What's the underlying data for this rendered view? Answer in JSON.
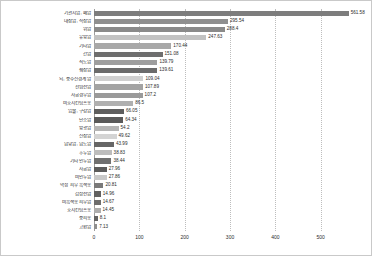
{
  "chart_data": {
    "type": "bar",
    "orientation": "horizontal",
    "title": "",
    "subtitle": "",
    "xlabel": "",
    "ylabel": "",
    "xlim": [
      0,
      580
    ],
    "xticks": [
      "0",
      "100",
      "200",
      "300",
      "400",
      "500"
    ],
    "xtick_values": [
      0,
      100,
      200,
      300,
      400,
      500
    ],
    "grid": true,
    "grid_axis": "x",
    "legend": false,
    "legend_position": "none",
    "categories": [
      "기관지암, 폐암",
      "대장암, 직장암",
      "위암",
      "유방암",
      "기타암",
      "간암",
      "식도암",
      "췌장암",
      "뇌, 중추신경계 암",
      "전립선암",
      "자궁경부암",
      "비호지킨림프종",
      "입술, 구강암",
      "난소암",
      "방광암",
      "신장암",
      "담낭암, 담도암",
      "후두암",
      "기타 인두암",
      "자궁암",
      "비인두암",
      "악성 피부 흑색종",
      "갑상선암",
      "비흑색종 피부암",
      "호지킨림프종",
      "중피종",
      "고환암"
    ],
    "values": [
      561.58,
      295.54,
      288.4,
      247.63,
      170.44,
      151.08,
      139.79,
      139.61,
      109.04,
      107.89,
      107.2,
      86.5,
      66.05,
      64.34,
      54.2,
      49.62,
      43.99,
      38.83,
      38.44,
      27.96,
      27.86,
      20.81,
      14.96,
      14.67,
      14.45,
      8.1,
      7.13
    ],
    "value_labels": [
      "561.58",
      "295.54",
      "288.4",
      "247.63",
      "170.44",
      "151.08",
      "139.79",
      "139.61",
      "109.04",
      "107.89",
      "107.2",
      "86.5",
      "66.05",
      "64.34",
      "54.2",
      "49.62",
      "43.99",
      "38.83",
      "38.44",
      "27.96",
      "27.86",
      "20.81",
      "14.96",
      "14.67",
      "14.45",
      "8.1",
      "7.13"
    ],
    "bar_colors": [
      "#7d7d7d",
      "#8f8f8f",
      "#8a8a8a",
      "#c2c2c2",
      "#a8a8a8",
      "#6e6e6e",
      "#9e9e9e",
      "#6b6b6b",
      "#d0d0d0",
      "#a3a3a3",
      "#9a9a9a",
      "#b0b0b0",
      "#5e5e5e",
      "#5a5a5a",
      "#b5b5b5",
      "#d4d4d4",
      "#666666",
      "#bdbdbd",
      "#707070",
      "#5c5c5c",
      "#c9c9c9",
      "#7a7a7a",
      "#616161",
      "#6d6d6d",
      "#adadad",
      "#636363",
      "#8f8f8f"
    ]
  },
  "frame": {
    "border_color": "#c9c9c9",
    "background": "#ffffff"
  }
}
